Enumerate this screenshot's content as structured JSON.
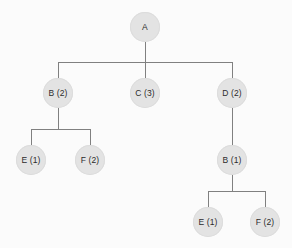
{
  "diagram": {
    "type": "tree",
    "background_color": "#fbfbfb",
    "node_fill_color": "#e3e3e3",
    "node_border_color": "#dcdcdc",
    "edge_color": "#808080",
    "label_color": "#2b2b2b",
    "node_diameter": 30,
    "nodes": [
      {
        "id": "n0",
        "label": "A",
        "cx": 145,
        "cy": 27,
        "r": 15,
        "level": 0
      },
      {
        "id": "n1",
        "label": "B (2)",
        "cx": 58,
        "cy": 93,
        "r": 15,
        "level": 1
      },
      {
        "id": "n2",
        "label": "C (3)",
        "cx": 145,
        "cy": 93,
        "r": 15,
        "level": 1
      },
      {
        "id": "n3",
        "label": "D (2)",
        "cx": 232,
        "cy": 93,
        "r": 15,
        "level": 1
      },
      {
        "id": "n4",
        "label": "E (1)",
        "cx": 31,
        "cy": 160,
        "r": 15,
        "level": 2
      },
      {
        "id": "n5",
        "label": "F (2)",
        "cx": 90,
        "cy": 160,
        "r": 15,
        "level": 2
      },
      {
        "id": "n6",
        "label": "B (1)",
        "cx": 232,
        "cy": 160,
        "r": 15,
        "level": 2
      },
      {
        "id": "n7",
        "label": "E (1)",
        "cx": 208,
        "cy": 222,
        "r": 15,
        "level": 3
      },
      {
        "id": "n8",
        "label": "F (2)",
        "cx": 265,
        "cy": 222,
        "r": 15,
        "level": 3
      }
    ],
    "edges": [
      {
        "from": "n0",
        "to": "n1"
      },
      {
        "from": "n0",
        "to": "n2"
      },
      {
        "from": "n0",
        "to": "n3"
      },
      {
        "from": "n1",
        "to": "n4"
      },
      {
        "from": "n1",
        "to": "n5"
      },
      {
        "from": "n3",
        "to": "n6"
      },
      {
        "from": "n6",
        "to": "n7"
      },
      {
        "from": "n6",
        "to": "n8"
      }
    ],
    "connectors": [
      {
        "name": "root-drop",
        "x1": 145,
        "y1": 42,
        "x2": 145,
        "y2": 62
      },
      {
        "name": "root-bus",
        "x1": 58,
        "y1": 62,
        "x2": 232,
        "y2": 62
      },
      {
        "name": "bus-to-b",
        "x1": 58,
        "y1": 62,
        "x2": 58,
        "y2": 78
      },
      {
        "name": "bus-to-c",
        "x1": 145,
        "y1": 62,
        "x2": 145,
        "y2": 78
      },
      {
        "name": "bus-to-d",
        "x1": 232,
        "y1": 62,
        "x2": 232,
        "y2": 78
      },
      {
        "name": "b-drop",
        "x1": 58,
        "y1": 108,
        "x2": 58,
        "y2": 129
      },
      {
        "name": "b-bus",
        "x1": 31,
        "y1": 129,
        "x2": 90,
        "y2": 129
      },
      {
        "name": "b-bus-to-e",
        "x1": 31,
        "y1": 129,
        "x2": 31,
        "y2": 145
      },
      {
        "name": "b-bus-to-f",
        "x1": 90,
        "y1": 129,
        "x2": 90,
        "y2": 145
      },
      {
        "name": "d-to-b1",
        "x1": 232,
        "y1": 108,
        "x2": 232,
        "y2": 145
      },
      {
        "name": "b1-drop",
        "x1": 232,
        "y1": 175,
        "x2": 232,
        "y2": 191
      },
      {
        "name": "b1-bus",
        "x1": 208,
        "y1": 191,
        "x2": 265,
        "y2": 191
      },
      {
        "name": "b1-bus-to-e",
        "x1": 208,
        "y1": 191,
        "x2": 208,
        "y2": 207
      },
      {
        "name": "b1-bus-to-f",
        "x1": 265,
        "y1": 191,
        "x2": 265,
        "y2": 207
      }
    ]
  }
}
